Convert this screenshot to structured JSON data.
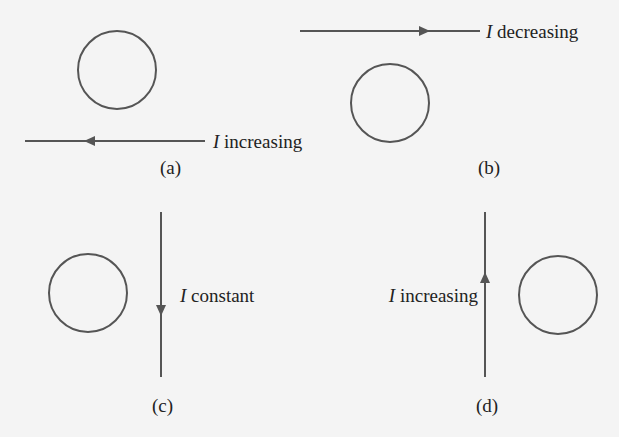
{
  "figure": {
    "stroke_color": "#555555",
    "text_color": "#222222",
    "background": "#f4f4f4",
    "panels": [
      {
        "id": "a",
        "caption": "(a)",
        "current_symbol": "I",
        "current_state": "increasing",
        "wire_orientation": "horizontal",
        "wire_position": "below loop",
        "current_direction": "left"
      },
      {
        "id": "b",
        "caption": "(b)",
        "current_symbol": "I",
        "current_state": "decreasing",
        "wire_orientation": "horizontal",
        "wire_position": "above loop",
        "current_direction": "right"
      },
      {
        "id": "c",
        "caption": "(c)",
        "current_symbol": "I",
        "current_state": "constant",
        "wire_orientation": "vertical",
        "wire_position": "right of loop",
        "current_direction": "down"
      },
      {
        "id": "d",
        "caption": "(d)",
        "current_symbol": "I",
        "current_state": "increasing",
        "wire_orientation": "vertical",
        "wire_position": "left of loop",
        "current_direction": "up"
      }
    ]
  }
}
